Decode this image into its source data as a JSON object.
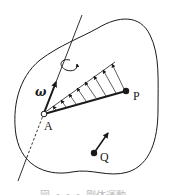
{
  "diagram": {
    "type": "rigid-body-rotation",
    "labels": {
      "omega": "ω",
      "point_a": "A",
      "point_p": "P",
      "point_q": "Q"
    },
    "caption": "図 ・・・ 剛体運動",
    "colors": {
      "stroke": "#1a1a1a",
      "background": "#ffffff",
      "caption": "#bbbbbb"
    },
    "elements": [
      "rigid-body-outline",
      "rotation-axis",
      "rotation-arrow",
      "angular-velocity-vector",
      "point-A-hollow",
      "segment-AP",
      "velocity-distribution-arrows",
      "point-P",
      "point-Q",
      "velocity-vector-Q"
    ]
  }
}
